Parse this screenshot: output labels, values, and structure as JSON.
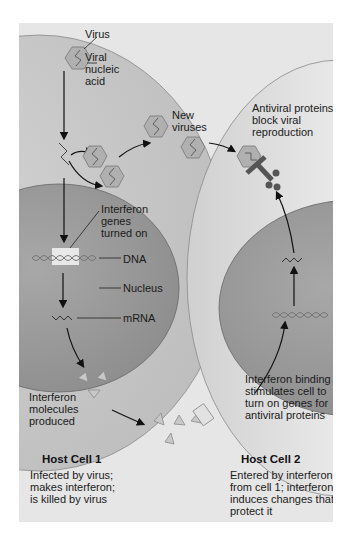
{
  "labels": {
    "virus": "Virus",
    "viral_nucleic_acid": "Viral\nnucleic\nacid",
    "new_viruses": "New\nviruses",
    "antiviral_proteins": "Antiviral proteins\nblock viral\nreproduction",
    "interferon_genes": "Interferon\ngenes\nturned on",
    "dna": "DNA",
    "nucleus": "Nucleus",
    "mrna": "mRNA",
    "interferon_molecules": "Interferon\nmolecules\nproduced",
    "interferon_binding": "Interferon binding\nstimulates cell to\nturn on genes for\nantiviral proteins"
  },
  "host_cell_1": {
    "title": "Host Cell 1",
    "description": "Infected by virus;\nmakes interferon;\nis killed by virus"
  },
  "host_cell_2": {
    "title": "Host Cell 2",
    "description": "Entered by interferon\nfrom cell 1; interferon\ninduces changes that\nprotect it"
  },
  "colors": {
    "panel_bg": "#e6e6e6",
    "cytoplasm": "#c8c8c8",
    "nucleus": "#9c9c9c",
    "virus_fill": "#a9a9a9",
    "antiviral_protein": "#555555",
    "arrow": "#111111"
  }
}
